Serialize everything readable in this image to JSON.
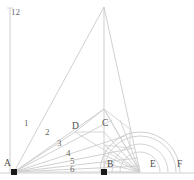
{
  "figure": {
    "axis_label": "12",
    "colors": {
      "line": "#c9c9c9",
      "line_light": "#d7d7d7",
      "arc": "#cccccc",
      "baseline": "#cfcfcf",
      "axis": "#cdcdcd",
      "marker": "#1a1a1a",
      "label": "#5a5a5a"
    },
    "points": [
      {
        "name": "A",
        "label": "A",
        "x": 14,
        "y": 172,
        "marker": true,
        "label_x": 4,
        "label_y": 159
      },
      {
        "name": "B",
        "label": "B",
        "x": 104,
        "y": 172,
        "marker": true,
        "label_x": 107,
        "label_y": 160
      },
      {
        "name": "C",
        "label": "C",
        "x": 104,
        "y": 109,
        "marker": false,
        "label_x": 102,
        "label_y": 119
      },
      {
        "name": "D",
        "label": "D",
        "x": 75,
        "y": 132,
        "marker": false,
        "label_x": 72,
        "label_y": 122
      },
      {
        "name": "E",
        "label": "E",
        "x": 140,
        "y": 172,
        "marker": false,
        "label_x": 150,
        "label_y": 160
      },
      {
        "name": "F",
        "label": "F",
        "x": 180,
        "y": 172,
        "marker": false,
        "label_x": 177,
        "label_y": 160
      }
    ],
    "ray_labels": [
      {
        "label": "1",
        "x": 24,
        "y": 119
      },
      {
        "label": "2",
        "x": 45,
        "y": 128
      },
      {
        "label": "3",
        "x": 57,
        "y": 139
      },
      {
        "label": "4",
        "x": 66,
        "y": 149
      },
      {
        "label": "5",
        "x": 70,
        "y": 157
      },
      {
        "label": "6",
        "x": 70,
        "y": 165
      }
    ],
    "apex": {
      "x": 104,
      "y": 7
    },
    "baseline": {
      "x1": 0,
      "y1": 173,
      "x2": 194,
      "y2": 173
    },
    "vertical_axis": {
      "x": 10,
      "y1": 8,
      "y2": 173
    },
    "arc_center": {
      "x": 140,
      "y": 172
    },
    "arc_radii": [
      20,
      28,
      36,
      40
    ]
  }
}
